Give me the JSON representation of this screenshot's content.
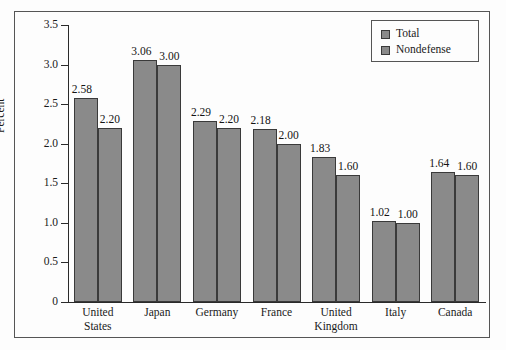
{
  "chart_data": {
    "type": "bar",
    "title": "",
    "xlabel": "",
    "ylabel": "Percent",
    "ylim": [
      0,
      3.5
    ],
    "ytick_labels": [
      "0",
      "0.5",
      "1.0",
      "1.5",
      "2.0",
      "2.5",
      "3.0",
      "3.5"
    ],
    "ytick_values": [
      0,
      0.5,
      1.0,
      1.5,
      2.0,
      2.5,
      3.0,
      3.5
    ],
    "grid": false,
    "legend_position": "top-right",
    "categories": [
      "United States",
      "Japan",
      "Germany",
      "France",
      "United Kingdom",
      "Italy",
      "Canada"
    ],
    "category_lines": [
      [
        "United",
        "States"
      ],
      [
        "Japan"
      ],
      [
        "Germany"
      ],
      [
        "France"
      ],
      [
        "United",
        "Kingdom"
      ],
      [
        "Italy"
      ],
      [
        "Canada"
      ]
    ],
    "series": [
      {
        "name": "Total",
        "color": "#8a8a8a",
        "values": [
          2.58,
          3.06,
          2.29,
          2.18,
          1.83,
          1.02,
          1.64
        ],
        "labels": [
          "2.58",
          "3.06",
          "2.29",
          "2.18",
          "1.83",
          "1.02",
          "1.64"
        ]
      },
      {
        "name": "Nondefense",
        "color": "#8a8a8a",
        "values": [
          2.2,
          3.0,
          2.2,
          2.0,
          1.6,
          1.0,
          1.6
        ],
        "labels": [
          "2.20",
          "3.00",
          "2.20",
          "2.00",
          "1.60",
          "1.00",
          "1.60"
        ]
      }
    ]
  },
  "legend": {
    "items": [
      {
        "label": "Total",
        "swatch": "#8a8a8a"
      },
      {
        "label": "Nondefense",
        "swatch": "#8a8a8a"
      }
    ]
  },
  "axis": {
    "y_title": "Percent"
  }
}
